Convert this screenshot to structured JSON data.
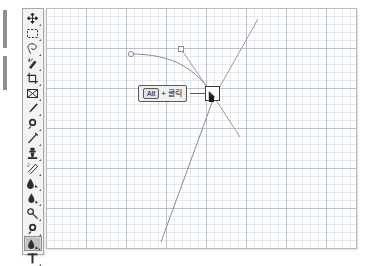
{
  "app": {
    "title": "Graphics editor path-editing illustration",
    "canvas_background": "#ffffff",
    "grid_color": "#96a0af",
    "canvas_border_color": "#b9b9b9"
  },
  "toolbar": {
    "name": "tools-palette",
    "selected_index": 15,
    "items": [
      {
        "icon": "move-tool-icon",
        "label": "Move"
      },
      {
        "icon": "rectangular-marquee-icon",
        "label": "Rectangular Marquee"
      },
      {
        "icon": "lasso-tool-icon",
        "label": "Lasso"
      },
      {
        "icon": "magic-wand-icon",
        "label": "Magic Wand"
      },
      {
        "icon": "crop-tool-icon",
        "label": "Crop"
      },
      {
        "icon": "slice-tool-icon",
        "label": "Slice"
      },
      {
        "icon": "healing-brush-icon",
        "label": "Healing Brush"
      },
      {
        "icon": "brush-tool-icon",
        "label": "Brush"
      },
      {
        "icon": "clone-stamp-icon",
        "label": "Clone Stamp"
      },
      {
        "icon": "history-brush-icon",
        "label": "History Brush"
      },
      {
        "icon": "eraser-tool-icon",
        "label": "Eraser"
      },
      {
        "icon": "gradient-tool-icon",
        "label": "Gradient"
      },
      {
        "icon": "blur-tool-icon",
        "label": "Blur"
      },
      {
        "icon": "dodge-tool-icon",
        "label": "Dodge"
      },
      {
        "icon": "path-selection-icon",
        "label": "Path Selection"
      },
      {
        "icon": "pen-tool-icon",
        "label": "Pen"
      },
      {
        "icon": "type-tool-icon",
        "label": "Horizontal Type"
      }
    ]
  },
  "callout": {
    "key_label": "Alt",
    "plus": "+",
    "action_label": "클릭",
    "box_border_color": "#595959",
    "box_background": "#f0f0f0"
  },
  "canvas": {
    "cursor_icon": "pen-convert-point-cursor-icon",
    "anchor_point_color": "#1b1b1b",
    "path_stroke_color": "#8b8b8b",
    "handle_stroke_color": "#9a9a9a",
    "handles": [
      {
        "type": "circle",
        "x": 129,
        "y": 52
      },
      {
        "type": "square",
        "x": 179,
        "y": 47
      }
    ]
  }
}
